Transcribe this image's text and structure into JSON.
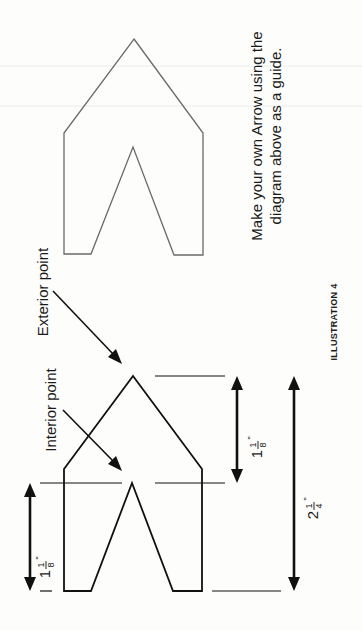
{
  "illustration": {
    "caption": "ILLUSTRATION 4",
    "instruction_line1": "Make your own Arrow using the",
    "instruction_line2": "diagram above as a guide.",
    "orientation": "rotated 90° counter-clockwise"
  },
  "labels": {
    "exterior_point": "Exterior point",
    "interior_point": "Interior point"
  },
  "dimensions": {
    "notch_depth": {
      "whole": "1",
      "num": "1",
      "den": "8",
      "unit": "\""
    },
    "head_length": {
      "whole": "1",
      "num": "1",
      "den": "8",
      "unit": "\""
    },
    "total_length": {
      "whole": "2",
      "num": "1",
      "den": "4",
      "unit": "\""
    }
  },
  "colors": {
    "ink": "#111111",
    "faint_outline": "#6a6a6a",
    "paper": "#fdfdfb"
  }
}
